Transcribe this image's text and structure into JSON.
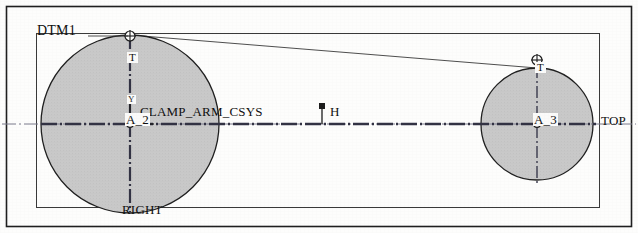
{
  "drawing": {
    "title": "CLAMP_ARM_CSYS",
    "background_color": "#fdfdfc",
    "line_color": "#2b2b2b",
    "fill_color": "#c9c9c9",
    "outer_frame": {
      "x": 6,
      "y": 6,
      "width": 626,
      "height": 221
    },
    "inner_frame": {
      "x": 36,
      "y": 33,
      "width": 564,
      "height": 175
    }
  },
  "labels": {
    "dtm1": "DTM1",
    "right": "RIGHT",
    "top": "TOP",
    "csys_name": "CLAMP_ARM_CSYS",
    "axis_a2": "A_2",
    "axis_a3": "A_3",
    "datum_h": "H",
    "datum_t_left": "T",
    "datum_t_right": "T",
    "axis_y": "Y"
  },
  "geometry": {
    "circle_left": {
      "cx": 130,
      "cy": 124,
      "r": 89,
      "axis": "A_2"
    },
    "circle_right": {
      "cx": 537,
      "cy": 124,
      "r": 56,
      "axis": "A_3"
    },
    "centerline_y": 124,
    "datum_point_h": {
      "x": 322,
      "y": 124
    }
  }
}
